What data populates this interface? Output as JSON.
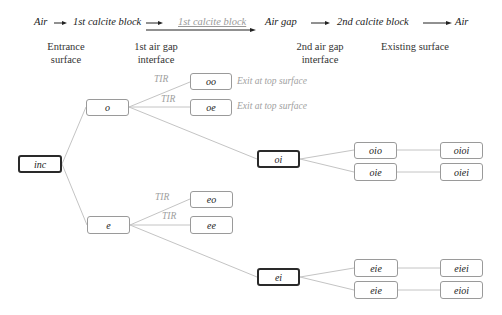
{
  "header": {
    "flow": [
      {
        "text": "Air",
        "style": "normal"
      },
      {
        "text": "1st calcite block",
        "style": "normal"
      },
      {
        "text": "1st calcite block",
        "style": "grey"
      },
      {
        "text": "Air gap",
        "style": "normal"
      },
      {
        "text": "2nd calcite block",
        "style": "normal"
      },
      {
        "text": "Air",
        "style": "normal"
      }
    ],
    "columns": [
      {
        "line1": "Entrance",
        "line2": "surface"
      },
      {
        "line1": "1st air gap",
        "line2": "interface"
      },
      {
        "line1": "2nd air gap",
        "line2": "interface"
      },
      {
        "line1": "Existing surface",
        "line2": ""
      }
    ]
  },
  "nodes": {
    "inc": "inc",
    "o": "o",
    "e": "e",
    "oo": "oo",
    "oe": "oe",
    "eo": "eo",
    "ee": "ee",
    "oi": "oi",
    "ei": "ei",
    "oio": "oio",
    "oie": "oie",
    "oioi": "oioi",
    "oiei": "oiei",
    "eie_top": "eie",
    "eie_bottom": "eie",
    "eiei": "eiei",
    "eioi": "eioi"
  },
  "labels": {
    "tir": "TIR",
    "exit_top": "Exit at top surface"
  },
  "colors": {
    "line": "#c8c8c8",
    "box_border": "#9a9a9a",
    "box_border_dark": "#2a2a2a",
    "muted_text": "#a0a0a0"
  }
}
